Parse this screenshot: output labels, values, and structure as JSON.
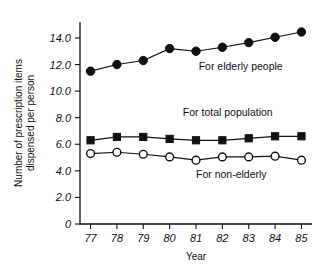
{
  "chart_data": {
    "type": "line",
    "title": "",
    "xlabel": "Year",
    "ylabel": "Number of prescription items dispensed per person",
    "ylabel_line1": "Number of prescription items",
    "ylabel_line2": "dispensed per person",
    "categories": [
      "77",
      "78",
      "79",
      "80",
      "81",
      "82",
      "83",
      "84",
      "85"
    ],
    "x": [
      77,
      78,
      79,
      80,
      81,
      82,
      83,
      84,
      85
    ],
    "xlim": [
      76.6,
      85.4
    ],
    "ylim": [
      0,
      15.2
    ],
    "grid": false,
    "legend_position": "inline-annotations",
    "ytick_labels": [
      "0",
      "2.0",
      "4.0",
      "6.0",
      "8.0",
      "10.0",
      "12.0",
      "14.0"
    ],
    "ytick_values": [
      0,
      2,
      4,
      6,
      8,
      10,
      12,
      14
    ],
    "series": [
      {
        "name": "For elderly people",
        "marker": "filled-circle",
        "values": [
          11.5,
          12.0,
          12.3,
          13.2,
          13.0,
          13.3,
          13.65,
          14.05,
          14.45
        ],
        "label_x": 81.1,
        "label_y": 11.6
      },
      {
        "name": "For total population",
        "marker": "filled-square",
        "values": [
          6.3,
          6.55,
          6.55,
          6.4,
          6.3,
          6.3,
          6.45,
          6.6,
          6.6
        ],
        "label_x": 80.5,
        "label_y": 8.1
      },
      {
        "name": "For non-elderly",
        "marker": "open-circle",
        "values": [
          5.3,
          5.4,
          5.25,
          5.05,
          4.8,
          5.05,
          5.05,
          5.1,
          4.8
        ],
        "label_x": 81.0,
        "label_y": 3.45
      }
    ]
  },
  "colors": {
    "ink": "#111111",
    "background": "#ffffff",
    "marker_fill": "#111111",
    "marker_open_fill": "#ffffff"
  }
}
